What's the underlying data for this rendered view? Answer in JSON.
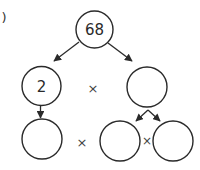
{
  "diagram": {
    "type": "factor-tree",
    "question_marker": ")",
    "colors": {
      "stroke": "#2a2a2a",
      "text": "#2a2a2a",
      "background": "#ffffff"
    },
    "nodes": [
      {
        "id": "root",
        "value": "68",
        "cx": 94.5,
        "cy": 29.5,
        "r": 18.5
      },
      {
        "id": "mid-left",
        "value": "2",
        "cx": 41.5,
        "cy": 86,
        "r": 19.5
      },
      {
        "id": "mid-right",
        "value": "",
        "cx": 147,
        "cy": 87,
        "r": 20
      },
      {
        "id": "bottom-left",
        "value": "",
        "cx": 42,
        "cy": 139,
        "r": 20
      },
      {
        "id": "bottom-middle",
        "value": "",
        "cx": 120,
        "cy": 141,
        "r": 20
      },
      {
        "id": "bottom-right",
        "value": "",
        "cx": 173,
        "cy": 141,
        "r": 20
      }
    ],
    "operators": [
      {
        "id": "times-middle-row",
        "symbol": "×",
        "x": 93,
        "y": 88
      },
      {
        "id": "times-bottom-left",
        "symbol": "×",
        "x": 82,
        "y": 142
      },
      {
        "id": "times-bottom-right",
        "symbol": "×",
        "x": 147,
        "y": 141
      }
    ],
    "edges": [
      {
        "from": "root",
        "to": "mid-left"
      },
      {
        "from": "root",
        "to": "mid-right"
      },
      {
        "from": "mid-left",
        "to": "bottom-left"
      },
      {
        "from": "mid-right",
        "to": "bottom-middle"
      },
      {
        "from": "mid-right",
        "to": "bottom-right"
      }
    ]
  }
}
